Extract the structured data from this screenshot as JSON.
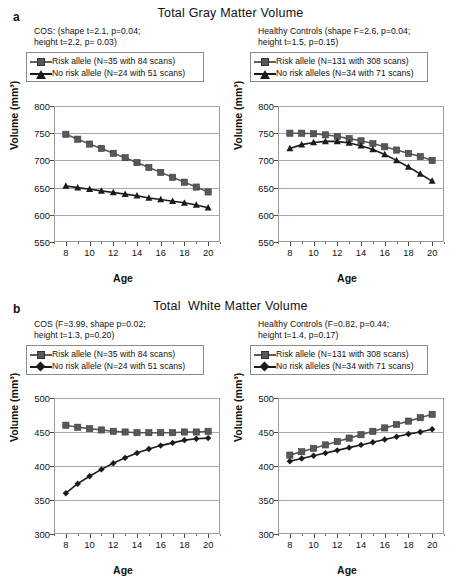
{
  "figure": {
    "panels": [
      {
        "letter": "a",
        "title": "Total Gray Matter Volume",
        "charts": [
          {
            "stats": "COS: (shape t=2.1, p=0.04;\nheight t=2.2, p= 0.03)",
            "legend": [
              {
                "label": "Risk allele (N=35 with 84 scans)",
                "marker": "square",
                "color": "#585858"
              },
              {
                "label": "No risk allele (N=24 with 51 scans)",
                "marker": "triangle",
                "color": "#1b1b1b"
              }
            ]
          },
          {
            "stats": "Healthy Controls  (shape F=2.6, p=0.04;\nheight t=1.5, p=0.15)",
            "legend": [
              {
                "label": "Risk allele (N=131 with 308 scans)",
                "marker": "square",
                "color": "#585858"
              },
              {
                "label": "No risk alleles (N=34 with 71 scans)",
                "marker": "triangle",
                "color": "#1b1b1b"
              }
            ]
          }
        ]
      },
      {
        "letter": "b",
        "title": "Total  White Matter Volume",
        "charts": [
          {
            "stats": "COS (F=3.99, shape p=0.02;\nheight t=1.3, p=0.20)",
            "legend": [
              {
                "label": "Risk allele (N=35 with 84 scans)",
                "marker": "square",
                "color": "#585858"
              },
              {
                "label": "No risk allele (N=24 with 51 scans)",
                "marker": "diamond",
                "color": "#1b1b1b"
              }
            ]
          },
          {
            "stats": "Healthy Controls (F=0.82, p=0.44;\nheight t=1.4, p=0.17)",
            "legend": [
              {
                "label": "Risk allele (N=131 with 308 scans)",
                "marker": "square",
                "color": "#585858"
              },
              {
                "label": "No risk alleles (N=34 with 71 scans)",
                "marker": "diamond",
                "color": "#1b1b1b"
              }
            ]
          }
        ]
      }
    ]
  },
  "chart_data": [
    {
      "id": "a-left",
      "type": "line",
      "title": "Total Gray Matter Volume",
      "subtitle": "COS: (shape t=2.1, p=0.04; height t=2.2, p= 0.03)",
      "xlabel": "Age",
      "ylabel": "Volume (mm³)",
      "xlim": [
        7,
        21
      ],
      "ylim": [
        550,
        800
      ],
      "yticks": [
        550,
        600,
        650,
        700,
        750,
        800
      ],
      "xticks": [
        8,
        10,
        12,
        14,
        16,
        18,
        20
      ],
      "grid": true,
      "legend_position": "above-plot",
      "x": [
        8,
        9,
        10,
        11,
        12,
        13,
        14,
        15,
        16,
        17,
        18,
        19,
        20
      ],
      "series": [
        {
          "name": "Risk allele (N=35 with 84 scans)",
          "marker": "square",
          "color": "#585858",
          "values": [
            748,
            739,
            730,
            722,
            713,
            705,
            696,
            687,
            678,
            669,
            660,
            651,
            642
          ]
        },
        {
          "name": "No risk allele (N=24 with 51 scans)",
          "marker": "triangle",
          "color": "#1b1b1b",
          "values": [
            653,
            650,
            647,
            644,
            641,
            638,
            635,
            631,
            628,
            625,
            622,
            618,
            613
          ]
        }
      ]
    },
    {
      "id": "a-right",
      "type": "line",
      "title": "Total Gray Matter Volume",
      "subtitle": "Healthy Controls (shape F=2.6, p=0.04; height t=1.5, p=0.15)",
      "xlabel": "Age",
      "ylabel": "Volume (mm³)",
      "xlim": [
        7,
        21
      ],
      "ylim": [
        550,
        800
      ],
      "yticks": [
        550,
        600,
        650,
        700,
        750,
        800
      ],
      "xticks": [
        8,
        10,
        12,
        14,
        16,
        18,
        20
      ],
      "grid": true,
      "legend_position": "above-plot",
      "x": [
        8,
        9,
        10,
        11,
        12,
        13,
        14,
        15,
        16,
        17,
        18,
        19,
        20
      ],
      "series": [
        {
          "name": "Risk allele (N=131 with 308 scans)",
          "marker": "square",
          "color": "#585858",
          "values": [
            750,
            750,
            749,
            747,
            744,
            740,
            736,
            731,
            725,
            719,
            713,
            707,
            700
          ]
        },
        {
          "name": "No risk alleles (N=34 with 71 scans)",
          "marker": "triangle",
          "color": "#1b1b1b",
          "values": [
            722,
            729,
            733,
            735,
            735,
            732,
            727,
            720,
            711,
            700,
            688,
            675,
            662
          ]
        }
      ]
    },
    {
      "id": "b-left",
      "type": "line",
      "title": "Total  White Matter Volume",
      "subtitle": "COS (F=3.99, shape p=0.02; height t=1.3, p=0.20)",
      "xlabel": "Age",
      "ylabel": "Volume (mm³)",
      "xlim": [
        7,
        21
      ],
      "ylim": [
        300,
        500
      ],
      "yticks": [
        300,
        350,
        400,
        450,
        500
      ],
      "xticks": [
        8,
        10,
        12,
        14,
        16,
        18,
        20
      ],
      "grid": true,
      "legend_position": "above-plot",
      "x": [
        8,
        9,
        10,
        11,
        12,
        13,
        14,
        15,
        16,
        17,
        18,
        19,
        20
      ],
      "series": [
        {
          "name": "Risk allele (N=35 with 84 scans)",
          "marker": "square",
          "color": "#585858",
          "values": [
            460,
            457,
            455,
            453,
            451,
            450,
            449,
            449,
            449,
            449,
            450,
            450,
            451
          ]
        },
        {
          "name": "No risk allele (N=24 with 51 scans)",
          "marker": "diamond",
          "color": "#1b1b1b",
          "values": [
            360,
            374,
            385,
            395,
            404,
            412,
            419,
            425,
            430,
            434,
            438,
            440,
            441
          ]
        }
      ]
    },
    {
      "id": "b-right",
      "type": "line",
      "title": "Total  White Matter Volume",
      "subtitle": "Healthy Controls (F=0.82, p=0.44; height t=1.4, p=0.17)",
      "xlabel": "Age",
      "ylabel": "Volume (mm³)",
      "xlim": [
        7,
        21
      ],
      "ylim": [
        300,
        500
      ],
      "yticks": [
        300,
        350,
        400,
        450,
        500
      ],
      "xticks": [
        8,
        10,
        12,
        14,
        16,
        18,
        20
      ],
      "grid": true,
      "legend_position": "above-plot",
      "x": [
        8,
        9,
        10,
        11,
        12,
        13,
        14,
        15,
        16,
        17,
        18,
        19,
        20
      ],
      "series": [
        {
          "name": "Risk allele (N=131 with 308 scans)",
          "marker": "square",
          "color": "#585858",
          "values": [
            416,
            421,
            426,
            431,
            436,
            441,
            446,
            451,
            456,
            461,
            466,
            471,
            476
          ]
        },
        {
          "name": "No risk alleles (N=34 with 71 scans)",
          "marker": "diamond",
          "color": "#1b1b1b",
          "values": [
            407,
            411,
            415,
            419,
            423,
            427,
            431,
            435,
            439,
            443,
            447,
            450,
            454
          ]
        }
      ]
    }
  ]
}
